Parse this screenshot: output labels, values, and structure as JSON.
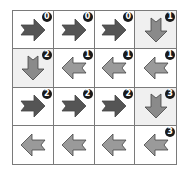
{
  "colors": {
    "right_arrow": "#555555",
    "left_arrow": "#9a9a9a",
    "down_arrow": "#8a8a8a",
    "arrow_stroke": "#444444",
    "shaded_cell": "#f0f0f0",
    "badge_bg": "#1a1a1a",
    "badge_text": "#ffffff",
    "grid_line": "#7a7a7a"
  },
  "grid": {
    "rows": 4,
    "cols": 4,
    "cells": [
      [
        {
          "direction": "right",
          "icon": "right-arrow-icon",
          "badge": "0",
          "shaded": false
        },
        {
          "direction": "right",
          "icon": "right-arrow-icon",
          "badge": "0",
          "shaded": false
        },
        {
          "direction": "right",
          "icon": "right-arrow-icon",
          "badge": "0",
          "shaded": false
        },
        {
          "direction": "down",
          "icon": "down-arrow-icon",
          "badge": "1",
          "shaded": true
        }
      ],
      [
        {
          "direction": "down",
          "icon": "down-arrow-icon",
          "badge": "2",
          "shaded": true
        },
        {
          "direction": "left",
          "icon": "left-arrow-icon",
          "badge": "1",
          "shaded": false
        },
        {
          "direction": "left",
          "icon": "left-arrow-icon",
          "badge": "1",
          "shaded": false
        },
        {
          "direction": "left",
          "icon": "left-arrow-icon",
          "badge": "1",
          "shaded": false
        }
      ],
      [
        {
          "direction": "right",
          "icon": "right-arrow-icon",
          "badge": "2",
          "shaded": false
        },
        {
          "direction": "right",
          "icon": "right-arrow-icon",
          "badge": "2",
          "shaded": false
        },
        {
          "direction": "right",
          "icon": "right-arrow-icon",
          "badge": "2",
          "shaded": false
        },
        {
          "direction": "down",
          "icon": "down-arrow-icon",
          "badge": "3",
          "shaded": true
        }
      ],
      [
        {
          "direction": "left",
          "icon": "left-arrow-icon",
          "badge": "",
          "shaded": false
        },
        {
          "direction": "left",
          "icon": "left-arrow-icon",
          "badge": "",
          "shaded": false
        },
        {
          "direction": "left",
          "icon": "left-arrow-icon",
          "badge": "",
          "shaded": false
        },
        {
          "direction": "left",
          "icon": "left-arrow-icon",
          "badge": "3",
          "shaded": false
        }
      ]
    ]
  }
}
